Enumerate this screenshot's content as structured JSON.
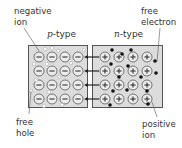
{
  "diagram": {
    "type": "pn-junction",
    "colors": {
      "box_fill": "#dcdcdc",
      "box_stroke": "#555555",
      "ion_stroke": "#555555",
      "ion_fill": "#ececec",
      "electron": "#111111",
      "hole_fill": "#ffffff",
      "hole_stroke": "#b0b0b0",
      "arrow": "#222222",
      "text": "#333333"
    },
    "regions": [
      {
        "id": "p",
        "label_prefix": "p",
        "label_suffix": "-type",
        "ion_sign": "−"
      },
      {
        "id": "n",
        "label_prefix": "n",
        "label_suffix": "-type",
        "ion_sign": "+"
      }
    ],
    "grid": {
      "rows": 4,
      "cols": 4
    },
    "arrows": {
      "count": 4,
      "direction": "left"
    },
    "labels": {
      "negative_ion": {
        "line1": "negative",
        "line2": "ion"
      },
      "free_electron": {
        "line1": "free",
        "line2": "electron"
      },
      "free_hole": {
        "line1": "free",
        "line2": "hole"
      },
      "positive_ion": {
        "line1": "positive",
        "line2": "ion"
      }
    }
  }
}
